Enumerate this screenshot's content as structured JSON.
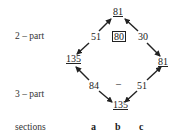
{
  "rows": {
    "two_part_label": "2 – part",
    "three_part_label": "3 – part",
    "sections_label": "sections"
  },
  "nodes": {
    "top": "81",
    "left": "135",
    "right": "81",
    "bottom": "135",
    "center_box": "80"
  },
  "edges": {
    "left_upper": "51",
    "right_upper": "30",
    "left_lower": "84",
    "right_lower": "51",
    "center_lower": "–"
  },
  "sections": [
    "a",
    "b",
    "c"
  ],
  "colors": {
    "ink": "#222222",
    "background": "#ffffff"
  }
}
